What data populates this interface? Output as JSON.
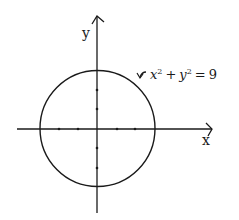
{
  "diagram": {
    "type": "coordinate-plot",
    "x_axis_label": "x",
    "y_axis_label": "y",
    "equation": {
      "lhs_x": "x",
      "exp_x": "2",
      "plus": "+",
      "lhs_y": "y",
      "exp_y": "2",
      "equals": "=",
      "rhs": "9",
      "full": "x^2 + y^2 = 9"
    },
    "circle": {
      "center": [
        0,
        0
      ],
      "radius": 3
    },
    "ticks": {
      "x": [
        -2,
        -1,
        1,
        2
      ],
      "y": [
        -2,
        -1,
        1,
        2
      ]
    },
    "colors": {
      "ink": "#1a1a1a",
      "background": "#ffffff"
    }
  }
}
